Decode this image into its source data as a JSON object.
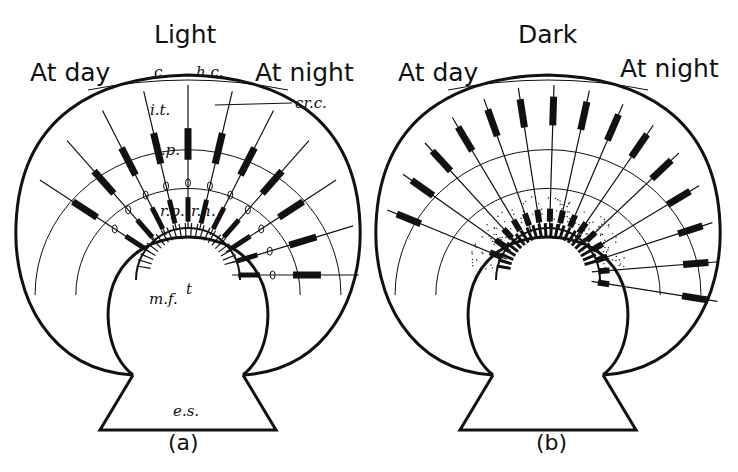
{
  "figure": {
    "panel_a": {
      "condition": "Light",
      "left_label": "At day",
      "right_label": "At night",
      "caption": "(a)",
      "annotations": {
        "c": "c.",
        "hc": "h.c.",
        "crc": "cr.c.",
        "it": "i.t.",
        "ip": "i.p.",
        "rp": "r.p.",
        "rh": "r.h.",
        "mf": "m.f.",
        "t": "t",
        "es": "e.s."
      },
      "center": [
        188,
        275
      ],
      "ommatidia_angles_deg": [
        -150,
        -135,
        -120,
        -105,
        -90,
        -75,
        -60,
        -45,
        -30,
        -15,
        0
      ],
      "pigment_state": "dispersed-proximal"
    },
    "panel_b": {
      "condition": "Dark",
      "left_label": "At day",
      "right_label": "At night",
      "caption": "(b)",
      "center": [
        548,
        275
      ],
      "ommatidia_angles_deg": [
        -160,
        -148,
        -136,
        -124,
        -112,
        -100,
        -88,
        -76,
        -64,
        -52,
        -40,
        -28,
        -16,
        -4,
        8
      ],
      "pigment_state": "distal"
    },
    "colors": {
      "ink": "#111111",
      "background": "#ffffff"
    }
  }
}
